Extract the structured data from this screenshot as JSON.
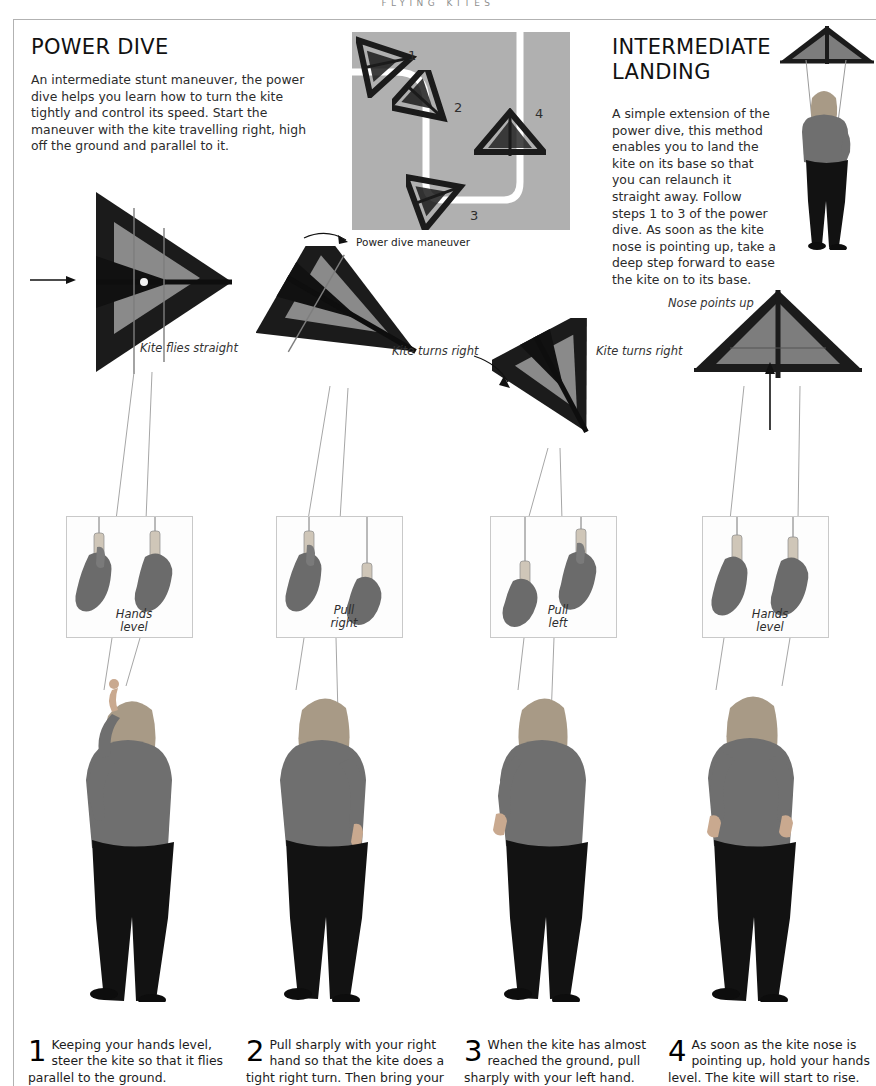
{
  "running_head": "Flying Kites",
  "sections": {
    "left": {
      "title": "Power Dive",
      "body": "An intermediate stunt maneuver, the power dive helps you learn how to turn the kite tightly and control its speed. Start the maneuver with the kite travelling right, high off the ground and parallel to it."
    },
    "right": {
      "title_line1": "Intermediate",
      "title_line2": "Landing",
      "body": "A simple extension of the power dive, this method enables you to land the kite on its base so that you can relaunch it straight away. Follow steps 1 to 3 of the power dive. As soon as the kite nose is pointing up, take a deep step forward to ease the kite on to its base."
    }
  },
  "diagram": {
    "caption": "Power dive maneuver",
    "markers": [
      "1",
      "2",
      "3",
      "4"
    ],
    "background_color": "#b0b0b0",
    "path_color": "#ffffff"
  },
  "annotations": {
    "kite1": "Kite flies straight",
    "kite2": "Kite turns right",
    "kite3": "Kite turns right",
    "kite4": "Nose points up"
  },
  "hand_panels": [
    {
      "label_line1": "Hands",
      "label_line2": "level"
    },
    {
      "label_line1": "Pull",
      "label_line2": "right"
    },
    {
      "label_line1": "Pull",
      "label_line2": "left"
    },
    {
      "label_line1": "Hands",
      "label_line2": "level"
    }
  ],
  "steps": [
    {
      "number": "1",
      "text": "Keeping your hands level, steer the kite so that it flies parallel to the ground."
    },
    {
      "number": "2",
      "text": "Pull sharply with your right hand so that the kite does a tight right turn. Then bring your"
    },
    {
      "number": "3",
      "text": "When the kite has almost reached the ground, pull sharply with your left hand."
    },
    {
      "number": "4",
      "text": "As soon as the kite nose is pointing up, hold your hands level. The kite will start to rise."
    }
  ],
  "colors": {
    "rule": "#b2b2b2",
    "kite_dark": "#1b1b1b",
    "kite_sail": "#8a8a8a",
    "sweater": "#6f6f6f",
    "trousers": "#121212",
    "hair": "#a89a86"
  }
}
